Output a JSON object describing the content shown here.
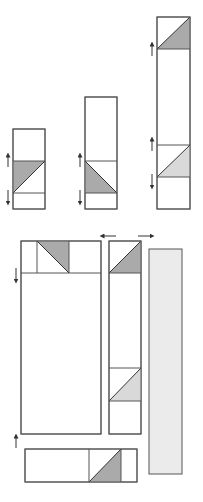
{
  "diagram": {
    "title": "",
    "colors": {
      "stroke": "#555555",
      "dark_fill": "#aaaaaa",
      "light_fill": "#d9d9d9",
      "bar_fill": "#ebebeb",
      "arrow": "#333333",
      "background": "#ffffff"
    },
    "top_row": [
      {
        "id": "column-short",
        "x": 13,
        "y": 129,
        "w": 32,
        "h": 80,
        "dividers": [
          161,
          193
        ]
      },
      {
        "id": "column-medium",
        "x": 85,
        "y": 97,
        "w": 32,
        "h": 112,
        "dividers": [
          161,
          193
        ]
      },
      {
        "id": "column-tall",
        "x": 157,
        "y": 17,
        "w": 33,
        "h": 192,
        "dividers": [
          49,
          145,
          177
        ]
      }
    ],
    "bottom_layout": {
      "large_panel": {
        "x": 21,
        "y": 241,
        "w": 80,
        "h": 193,
        "top_strip_bottom": 273,
        "verticals": [
          37,
          69
        ]
      },
      "side_column": {
        "x": 109,
        "y": 241,
        "w": 32,
        "h": 193,
        "dividers": [
          273,
          368,
          401
        ]
      },
      "gray_bar": {
        "x": 149,
        "y": 249,
        "w": 33,
        "h": 225
      },
      "bottom_strip": {
        "x": 25,
        "y": 449,
        "w": 112,
        "h": 33,
        "verticals": [
          89,
          121
        ]
      }
    },
    "arrows": [
      {
        "dir": "up",
        "x": 8,
        "y": 160
      },
      {
        "dir": "down",
        "x": 8,
        "y": 196
      },
      {
        "dir": "up",
        "x": 80,
        "y": 160
      },
      {
        "dir": "down",
        "x": 80,
        "y": 196
      },
      {
        "dir": "up",
        "x": 152,
        "y": 48
      },
      {
        "dir": "up",
        "x": 152,
        "y": 144
      },
      {
        "dir": "down",
        "x": 152,
        "y": 180
      },
      {
        "dir": "left",
        "x": 108,
        "y": 236
      },
      {
        "dir": "right",
        "x": 146,
        "y": 236
      },
      {
        "dir": "down",
        "x": 16,
        "y": 274
      },
      {
        "dir": "up",
        "x": 16,
        "y": 442
      }
    ]
  }
}
